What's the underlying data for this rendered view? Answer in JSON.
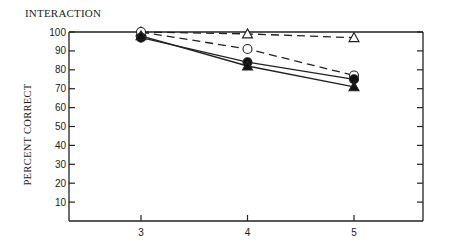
{
  "chart_data": {
    "type": "line",
    "title": "INTERACTION",
    "xlabel": "",
    "ylabel": "PERCENT CORRECT",
    "x": [
      3,
      4,
      5
    ],
    "xticks": [
      "3",
      "4",
      "5"
    ],
    "yticks": [
      "10",
      "20",
      "30",
      "40",
      "50",
      "60",
      "70",
      "80",
      "90",
      "100"
    ],
    "ylim": [
      0,
      100
    ],
    "xlim": [
      2.35,
      5.7
    ],
    "grid": false,
    "legend": "none",
    "frame": "box with inward ticks on right",
    "series": [
      {
        "name": "open-triangle",
        "marker": "open-triangle",
        "line": "dashed",
        "values": [
          100,
          99,
          97
        ]
      },
      {
        "name": "open-circle",
        "marker": "open-circle",
        "line": "dashed",
        "values": [
          100,
          91,
          77
        ]
      },
      {
        "name": "filled-circle",
        "marker": "filled-circle",
        "line": "solid",
        "values": [
          97,
          84,
          75
        ]
      },
      {
        "name": "filled-triangle",
        "marker": "filled-triangle",
        "line": "solid",
        "values": [
          98,
          82,
          71
        ]
      }
    ]
  }
}
